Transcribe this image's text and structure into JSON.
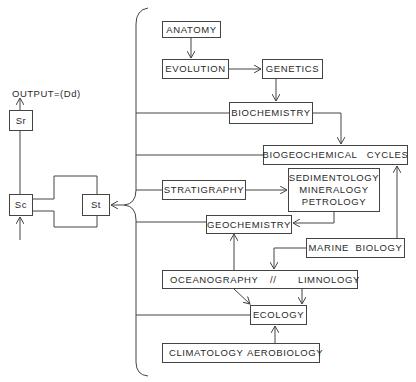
{
  "output_label": "OUTPUT=(Dd)",
  "system_boxes": {
    "sr": "Sr",
    "sc": "Sc",
    "st": "St"
  },
  "discipline_boxes": {
    "anatomy": "ANATOMY",
    "evolution": "EVOLUTION",
    "genetics": "GENETICS",
    "biochemistry": "BIOCHEMISTRY",
    "biogeochemical_cycles": "BIOGEOCHEMICAL   CYCLES",
    "stratigraphy": "STRATIGRAPHY",
    "sedimentology_group": [
      "SEDIMENTOLOGY",
      "MINERALOGY",
      "PETROLOGY"
    ],
    "geochemistry": "GEOCHEMISTRY",
    "marine_biology": "MARINE  BIOLOGY",
    "oceanography": "OCEANOGRAPHY",
    "separator": "//",
    "limnology": "LIMNOLOGY",
    "ecology": "ECOLOGY",
    "climatology": "CLIMATOLOGY",
    "aerobiology": "AEROBIOLOGY"
  },
  "colors": {
    "line": "#444444",
    "text": "#2a2a2a",
    "background": "#ffffff"
  }
}
